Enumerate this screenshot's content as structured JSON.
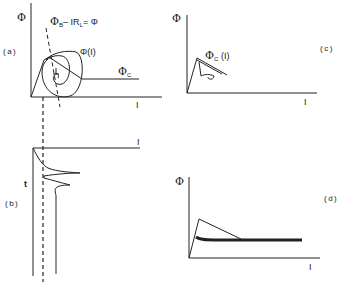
{
  "figure": {
    "panels": [
      {
        "id": "a",
        "label": "(a)",
        "y_axis": "Φ",
        "x_axis": "I",
        "annotations": {
          "loadline_phi": "Φ",
          "loadline_sub": "B",
          "loadline_mid": "– IR",
          "loadline_sub2": "L",
          "loadline_end": "= Φ",
          "curve": "Φ(I)",
          "critical": "Φ",
          "critical_sub": "C"
        }
      },
      {
        "id": "b",
        "label": "(b)",
        "y_axis": "t",
        "x_axis": "I"
      },
      {
        "id": "c",
        "label": "(c)",
        "y_axis": "Φ",
        "x_axis": "I",
        "annotations": {
          "curve_phi": "Φ",
          "curve_sub": "C",
          "curve_arg": "(I)"
        }
      },
      {
        "id": "d",
        "label": "(d)",
        "y_axis": "Φ",
        "x_axis": "I"
      }
    ],
    "colors": {
      "ink": "#222222",
      "background": "#ffffff"
    }
  }
}
